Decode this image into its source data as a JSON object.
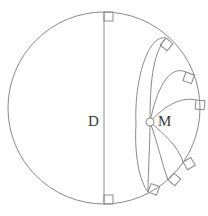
{
  "figure": {
    "type": "geometry-diagram",
    "background_color": "#ffffff",
    "stroke_color": "#8a8a8a",
    "label_color": "#3a3a3a",
    "stroke_width": 1,
    "labels": {
      "diameter_label": "D",
      "point_label": "M"
    },
    "main_circle": {
      "name": "boundary-circle",
      "cx": 104,
      "cy": 108,
      "r": 96
    },
    "diameter_line": {
      "name": "vertical-diameter",
      "x1": 104,
      "y1": 12,
      "x2": 104,
      "y2": 204
    },
    "point_M": {
      "cx": 150,
      "cy": 122,
      "r": 4
    },
    "right_angle_marks": [
      {
        "id": "top-diameter",
        "x": 104,
        "y": 12,
        "angle": 0,
        "size": 9
      },
      {
        "id": "bottom-diameter",
        "x": 104,
        "y": 204,
        "angle": 270,
        "size": 9
      },
      {
        "id": "arc-1-upper",
        "x": 166,
        "y": 38,
        "angle": 40,
        "size": 9
      },
      {
        "id": "arc-2-upper",
        "x": 186,
        "y": 72,
        "angle": 20,
        "size": 9
      },
      {
        "id": "arc-3-upper",
        "x": 196,
        "y": 100,
        "angle": 5,
        "size": 9
      },
      {
        "id": "arc-3-lower",
        "x": 183,
        "y": 162,
        "angle": 330,
        "size": 9
      },
      {
        "id": "arc-2-lower",
        "x": 168,
        "y": 180,
        "angle": 310,
        "size": 9
      },
      {
        "id": "arc-1-lower",
        "x": 148,
        "y": 192,
        "angle": 290,
        "size": 9
      }
    ],
    "orthogonal_arcs": [
      {
        "id": "arc-upper-1",
        "d": "M 150 122 C 150 86 152 54 166 38"
      },
      {
        "id": "arc-upper-2",
        "d": "M 150 122 C 156 92 168 64 186 72"
      },
      {
        "id": "arc-upper-3",
        "d": "M 150 122 C 162 108 180 96 196 100"
      },
      {
        "id": "arc-lower-3",
        "d": "M 150 122 C 164 134 178 146 183 162"
      },
      {
        "id": "arc-lower-2",
        "d": "M 150 122 C 158 144 162 164 168 180"
      },
      {
        "id": "arc-lower-1",
        "d": "M 150 122 C 150 148 148 172 148 192"
      },
      {
        "id": "arc-big-upper",
        "d": "M 136 124 C 134 80 148 34 166 38"
      },
      {
        "id": "arc-big-lower",
        "d": "M 136 124 C 134 156 140 182 148 192"
      }
    ]
  }
}
